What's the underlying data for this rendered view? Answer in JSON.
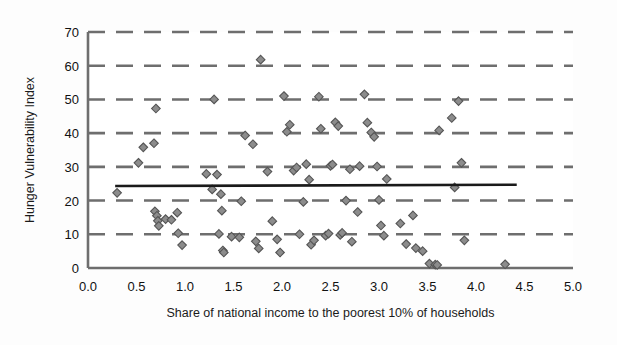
{
  "chart_data": {
    "type": "scatter",
    "title": "",
    "xlabel": "Share of national income to the poorest 10% of households",
    "ylabel": "Hunger Vulnerability Index",
    "xlim": [
      0.0,
      5.0
    ],
    "ylim": [
      0,
      70
    ],
    "xticks": [
      "0.0",
      "0.5",
      "1.0",
      "1.5",
      "2.0",
      "2.5",
      "3.0",
      "3.5",
      "4.0",
      "4.5",
      "5.0"
    ],
    "xtick_values": [
      0.0,
      0.5,
      1.0,
      1.5,
      2.0,
      2.5,
      3.0,
      3.5,
      4.0,
      4.5,
      5.0
    ],
    "yticks": [
      "0",
      "10",
      "20",
      "30",
      "40",
      "50",
      "60",
      "70"
    ],
    "ytick_values": [
      0,
      10,
      20,
      30,
      40,
      50,
      60,
      70
    ],
    "grid": "horizontal-dashed",
    "legend": "none",
    "marker": "diamond",
    "marker_color": "#8c8c8c",
    "marker_edge_color": "#555555",
    "gridline_color": "#6e6e6e",
    "axis_color": "#6e6e6e",
    "trendline_color": "#1a1a1a",
    "series": [
      {
        "name": "Countries",
        "points": [
          [
            0.3,
            22.3
          ],
          [
            0.52,
            31.2
          ],
          [
            0.57,
            35.8
          ],
          [
            0.68,
            37.0
          ],
          [
            0.69,
            16.8
          ],
          [
            0.7,
            47.3
          ],
          [
            0.71,
            15.5
          ],
          [
            0.72,
            14.0
          ],
          [
            0.73,
            12.5
          ],
          [
            0.8,
            14.5
          ],
          [
            0.86,
            14.3
          ],
          [
            0.92,
            16.4
          ],
          [
            0.93,
            10.3
          ],
          [
            0.97,
            6.8
          ],
          [
            1.22,
            27.9
          ],
          [
            1.28,
            23.3
          ],
          [
            1.3,
            50.0
          ],
          [
            1.33,
            27.7
          ],
          [
            1.35,
            10.1
          ],
          [
            1.37,
            21.9
          ],
          [
            1.38,
            17.0
          ],
          [
            1.39,
            5.2
          ],
          [
            1.4,
            4.6
          ],
          [
            1.48,
            9.3
          ],
          [
            1.56,
            9.1
          ],
          [
            1.58,
            19.8
          ],
          [
            1.62,
            39.3
          ],
          [
            1.7,
            36.7
          ],
          [
            1.73,
            7.9
          ],
          [
            1.76,
            5.8
          ],
          [
            1.78,
            61.8
          ],
          [
            1.85,
            28.6
          ],
          [
            1.9,
            13.9
          ],
          [
            1.95,
            8.5
          ],
          [
            1.98,
            4.6
          ],
          [
            2.02,
            51.0
          ],
          [
            2.05,
            40.4
          ],
          [
            2.08,
            42.5
          ],
          [
            2.12,
            28.9
          ],
          [
            2.15,
            29.8
          ],
          [
            2.18,
            10.0
          ],
          [
            2.22,
            19.6
          ],
          [
            2.25,
            30.8
          ],
          [
            2.28,
            26.2
          ],
          [
            2.3,
            6.9
          ],
          [
            2.33,
            8.2
          ],
          [
            2.38,
            50.8
          ],
          [
            2.4,
            41.3
          ],
          [
            2.45,
            9.6
          ],
          [
            2.48,
            10.2
          ],
          [
            2.5,
            30.3
          ],
          [
            2.52,
            30.7
          ],
          [
            2.55,
            43.2
          ],
          [
            2.58,
            42.1
          ],
          [
            2.6,
            9.8
          ],
          [
            2.62,
            10.4
          ],
          [
            2.66,
            20.0
          ],
          [
            2.7,
            29.3
          ],
          [
            2.72,
            7.8
          ],
          [
            2.78,
            16.6
          ],
          [
            2.8,
            30.2
          ],
          [
            2.85,
            51.5
          ],
          [
            2.88,
            43.1
          ],
          [
            2.92,
            40.2
          ],
          [
            2.95,
            38.9
          ],
          [
            2.98,
            30.1
          ],
          [
            3.0,
            20.2
          ],
          [
            3.02,
            12.6
          ],
          [
            3.05,
            9.6
          ],
          [
            3.08,
            26.4
          ],
          [
            3.22,
            13.2
          ],
          [
            3.28,
            7.1
          ],
          [
            3.35,
            15.6
          ],
          [
            3.38,
            5.9
          ],
          [
            3.45,
            5.0
          ],
          [
            3.52,
            1.3
          ],
          [
            3.58,
            1.0
          ],
          [
            3.6,
            0.9
          ],
          [
            3.62,
            40.8
          ],
          [
            3.75,
            44.5
          ],
          [
            3.78,
            23.9
          ],
          [
            3.82,
            49.5
          ],
          [
            3.85,
            31.2
          ],
          [
            3.88,
            8.2
          ],
          [
            4.3,
            1.1
          ]
        ]
      }
    ],
    "trendline": {
      "name": "Linear trend",
      "x_start": 0.28,
      "x_end": 4.42,
      "y_start": 24.3,
      "y_end": 24.7
    }
  }
}
